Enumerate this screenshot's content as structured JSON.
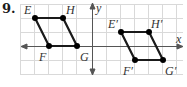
{
  "problem_number": "9.",
  "axes": {
    "x_label": "x",
    "y_label": "y"
  },
  "original": {
    "points": [
      {
        "name": "E",
        "label": "E"
      },
      {
        "name": "H",
        "label": "H"
      },
      {
        "name": "F",
        "label": "F"
      },
      {
        "name": "G",
        "label": "G"
      }
    ]
  },
  "image": {
    "points": [
      {
        "name": "E'",
        "label": "E′"
      },
      {
        "name": "H'",
        "label": "H′"
      },
      {
        "name": "F'",
        "label": "F′"
      },
      {
        "name": "G'",
        "label": "G′"
      }
    ]
  },
  "colors": {
    "grid": "#d9d9d9",
    "axis": "#555555",
    "shape": "#1a1a1a"
  }
}
